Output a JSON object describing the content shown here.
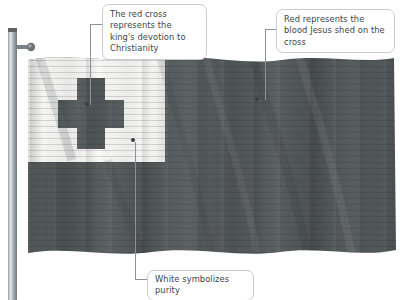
{
  "scene": {
    "title": "Flag of Tonga annotated diagram",
    "background_color": "#ffffff"
  },
  "flag": {
    "name": "flag-of-tonga",
    "field_color": "#565b5b",
    "canton_color": "#f4f4f2",
    "cross_color": "#555a5a",
    "shadow_color": "#3f4446",
    "pole_color": "#8e9296",
    "pole_highlight": "#d4d7da",
    "finial_color": "#6e7377"
  },
  "annotations": [
    {
      "id": "cross-note",
      "name": "callout-cross-meaning",
      "text": "The red cross represents the king's devotion to Christianity",
      "target": "red-cross"
    },
    {
      "id": "red-note",
      "name": "callout-red-meaning",
      "text": "Red represents the blood Jesus shed on the cross",
      "target": "red-field"
    },
    {
      "id": "white-note",
      "name": "callout-white-meaning",
      "text": "White symbolizes purity",
      "target": "white-canton"
    }
  ],
  "leader_lines": {
    "cross_dot": "87,104",
    "red_dot": "257,99",
    "white_dot": "133,141"
  }
}
